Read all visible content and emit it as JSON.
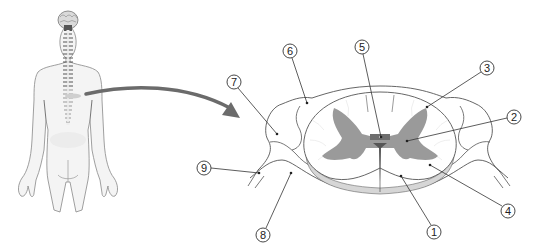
{
  "figure": {
    "type": "anatomical-diagram"
  },
  "colors": {
    "gray_matter": "#9a9a9a",
    "white_matter": "#ffffff",
    "body_fill": "#f3f3f3",
    "outline": "#555555",
    "arrow": "#6b6b6b",
    "nervous_system": "#6a6a6a"
  },
  "body_figure": {
    "view": "posterior",
    "shows": [
      "brain",
      "spinal cord",
      "spinal nerves"
    ]
  },
  "arrow": {
    "from": "mid-back spinal cord",
    "to": "cross-section"
  },
  "callouts": [
    {
      "number": "1",
      "cx": 434,
      "cy": 232,
      "target_x": 401,
      "target_y": 176
    },
    {
      "number": "2",
      "cx": 514,
      "cy": 117,
      "target_x": 407,
      "target_y": 141
    },
    {
      "number": "3",
      "cx": 487,
      "cy": 68,
      "target_x": 427,
      "target_y": 107
    },
    {
      "number": "4",
      "cx": 508,
      "cy": 211,
      "target_x": 430,
      "target_y": 165
    },
    {
      "number": "5",
      "cx": 362,
      "cy": 47,
      "target_x": 381,
      "target_y": 137
    },
    {
      "number": "6",
      "cx": 290,
      "cy": 51,
      "target_x": 307,
      "target_y": 103
    },
    {
      "number": "7",
      "cx": 234,
      "cy": 82,
      "target_x": 277,
      "target_y": 134
    },
    {
      "number": "8",
      "cx": 263,
      "cy": 235,
      "target_x": 291,
      "target_y": 173
    },
    {
      "number": "9",
      "cx": 204,
      "cy": 168,
      "target_x": 259,
      "target_y": 173
    }
  ]
}
